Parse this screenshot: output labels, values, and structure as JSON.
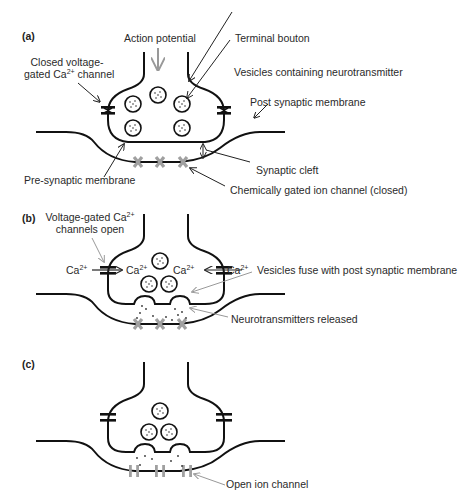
{
  "panels": {
    "a": {
      "tag": "(a)",
      "labels": {
        "action_potential": "Action potential",
        "terminal_bouton": "Terminal bouton",
        "closed_channel_line1": "Closed voltage-",
        "closed_channel_line2_pre": "gated Ca",
        "closed_channel_sup": "2+",
        "closed_channel_line2_post": " channel",
        "vesicles": "Vesicles containing neurotransmitter",
        "post_synaptic_membrane": "Post synaptic membrane",
        "synaptic_cleft": "Synaptic cleft",
        "pre_synaptic_membrane": "Pre-synaptic membrane",
        "chem_gated_channel": "Chemically gated ion channel (closed)"
      }
    },
    "b": {
      "tag": "(b)",
      "labels": {
        "open_channels_line1_pre": "Voltage-gated Ca",
        "open_channels_sup": "2+",
        "open_channels_line2": "channels open",
        "ca_base": "Ca",
        "ca_sup": "2+",
        "vesicles_fuse": "Vesicles fuse with post synaptic membrane",
        "nt_released": "Neurotransmitters released"
      }
    },
    "c": {
      "tag": "(c)",
      "labels": {
        "open_ion_channel": "Open ion channel"
      }
    }
  },
  "colors": {
    "stroke": "#111111",
    "arrow_gray": "#999999",
    "channel_gray": "#a0a0a0",
    "text": "#2a2a2a"
  }
}
